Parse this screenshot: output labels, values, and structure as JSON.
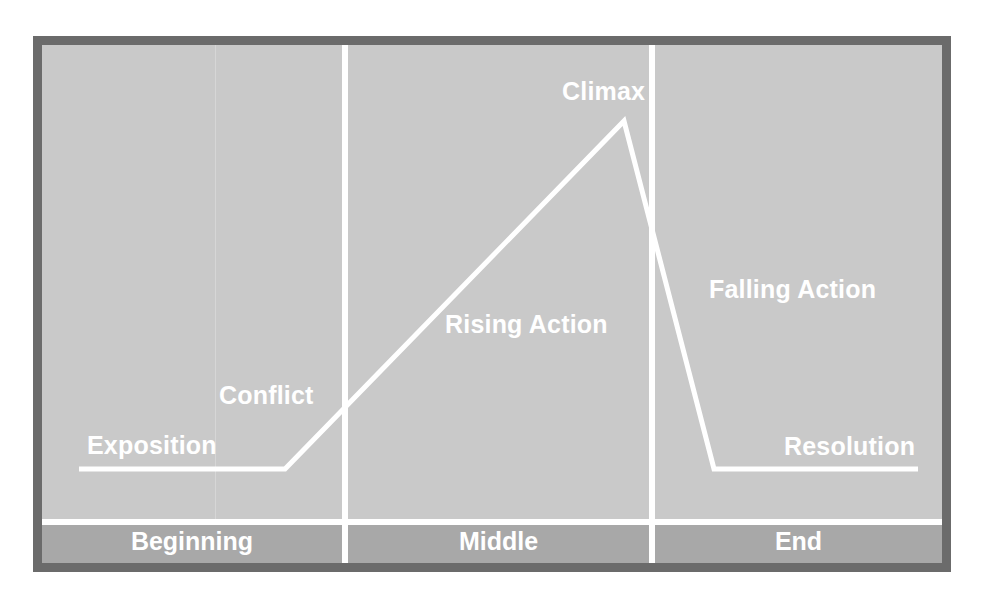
{
  "diagram": {
    "type": "plot-structure",
    "points": {
      "exposition": "Exposition",
      "conflict": "Conflict",
      "rising_action": "Rising Action",
      "climax": "Climax",
      "falling_action": "Falling Action",
      "resolution": "Resolution"
    },
    "segments": [
      {
        "label": "Beginning"
      },
      {
        "label": "Middle"
      },
      {
        "label": "End"
      }
    ],
    "colors": {
      "frame": "#6b6b6b",
      "plot_bg": "#c9c9c9",
      "footer_bg": "#a8a8a8",
      "line": "#ffffff",
      "text": "#ffffff"
    }
  }
}
